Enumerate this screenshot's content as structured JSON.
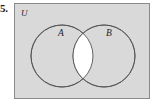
{
  "figure": {
    "item_number": "5.",
    "type": "venn-diagram",
    "universe_label": "U",
    "set_labels": {
      "left": "A",
      "right": "B"
    },
    "shading": {
      "universe_fill": "#d9d9d9",
      "circle_fill": "#d9d9d9",
      "intersection_fill": "#ffffff",
      "outline_color": "#555555",
      "border_color": "#8a8a8a",
      "page_background": "#ffffff",
      "label_color": "#1f1f1f"
    },
    "geometry": {
      "rect": {
        "x": 14,
        "y": 3,
        "width": 136,
        "height": 96
      },
      "circle_a": {
        "cx": 62,
        "cy": 56,
        "r": 31
      },
      "circle_b": {
        "cx": 104,
        "cy": 56,
        "r": 31
      },
      "universe_label_pos": {
        "x": 21,
        "y": 16
      },
      "label_a_pos": {
        "x": 58,
        "y": 36
      },
      "label_b_pos": {
        "x": 106,
        "y": 36
      }
    }
  }
}
